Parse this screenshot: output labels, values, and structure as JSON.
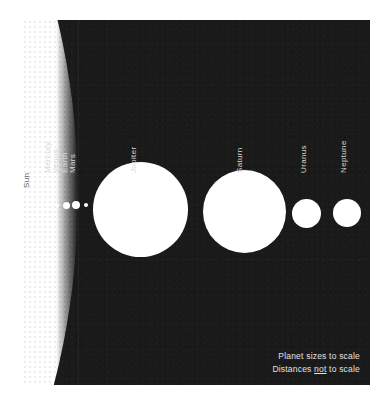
{
  "figure": {
    "background_color": "#ffffff",
    "plate_color": "#1a1a1a",
    "body_color": "#ffffff",
    "label_color": "#d8d8d8",
    "sun_label_color": "#5e5e5e"
  },
  "chart_data": {
    "type": "scatter",
    "title": "Planet sizes to scale",
    "xlabel": "",
    "ylabel": "",
    "grid": false,
    "legend": "none",
    "note": "Bodies drawn as filled white discs on a dark plate; horizontal spacing is arbitrary.",
    "categories": [
      "Sun",
      "Mercury",
      "Venus",
      "Earth",
      "Mars",
      "Jupiter",
      "Saturn",
      "Uranus",
      "Neptune"
    ],
    "values": [
      365,
      3,
      7,
      8,
      4,
      95,
      83,
      29,
      28
    ],
    "value_units": "rendered diameter in pixels",
    "bodies": [
      {
        "name": "Sun",
        "label": "Sun",
        "diameter_px": 1516,
        "center_x": -702,
        "center_y": 175,
        "label_x": 9,
        "label_bottom": 160,
        "on_sun": true
      },
      {
        "name": "Mercury",
        "label": "Mercury",
        "diameter_px": 3,
        "center_x": 35,
        "center_y": 185,
        "label_x": 30,
        "label_bottom": 145,
        "on_sun": false
      },
      {
        "name": "Venus",
        "label": "Venus",
        "diameter_px": 7,
        "center_x": 44,
        "center_y": 185,
        "label_x": 38,
        "label_bottom": 145,
        "on_sun": false
      },
      {
        "name": "Earth",
        "label": "Earth",
        "diameter_px": 8,
        "center_x": 54,
        "center_y": 185,
        "label_x": 47,
        "label_bottom": 145,
        "on_sun": false
      },
      {
        "name": "Mars",
        "label": "Mars",
        "diameter_px": 4,
        "center_x": 64,
        "center_y": 185,
        "label_x": 55,
        "label_bottom": 145,
        "on_sun": false
      },
      {
        "name": "Jupiter",
        "label": "Jupiter",
        "diameter_px": 95,
        "center_x": 118,
        "center_y": 189,
        "label_x": 116,
        "label_bottom": 145,
        "on_sun": false
      },
      {
        "name": "Saturn",
        "label": "Saturn",
        "diameter_px": 83,
        "center_x": 222,
        "center_y": 191,
        "label_x": 222,
        "label_bottom": 145,
        "on_sun": false
      },
      {
        "name": "Uranus",
        "label": "Uranus",
        "diameter_px": 29,
        "center_x": 284,
        "center_y": 193,
        "label_x": 286,
        "label_bottom": 145,
        "on_sun": false
      },
      {
        "name": "Neptune",
        "label": "Neptune",
        "diameter_px": 28,
        "center_x": 325,
        "center_y": 193,
        "label_x": 326,
        "label_bottom": 145,
        "on_sun": false
      }
    ]
  },
  "caption": {
    "line1": "Planet sizes to scale",
    "line2_before": "Distances ",
    "line2_emphasis": "not",
    "line2_after": " to scale"
  }
}
